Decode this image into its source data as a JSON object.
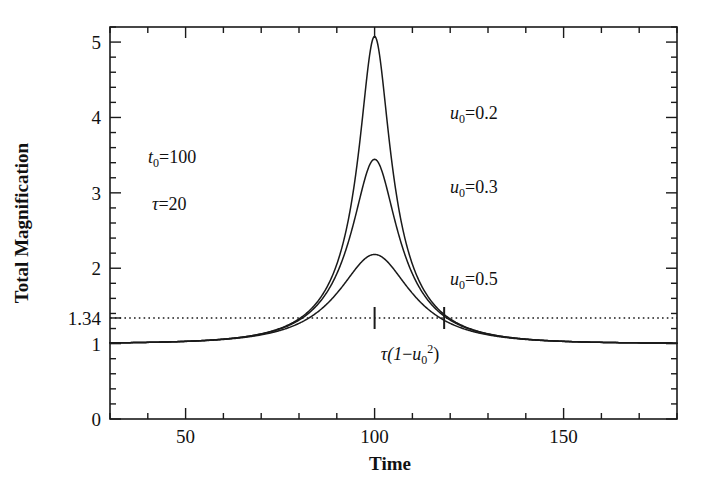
{
  "chart_data": {
    "type": "line",
    "title": "",
    "xlabel": "Time",
    "ylabel": "Total Magnification",
    "xlim": [
      30,
      180
    ],
    "ylim": [
      0,
      5.2
    ],
    "xticks_major": [
      50,
      100,
      150
    ],
    "xticks_major_labels": [
      "50",
      "100",
      "150"
    ],
    "xtick_minor_step": 10,
    "yticks_major": [
      0,
      1,
      2,
      3,
      4,
      5
    ],
    "yticks_major_labels": [
      "0",
      "1",
      "2",
      "3",
      "4",
      "5"
    ],
    "ytick_minor_step": 0.2,
    "extra_ytick": 1.34,
    "extra_ytick_label": "1.34",
    "grid": false,
    "legend": "inline-annotations",
    "reference_line": {
      "value": 1.34,
      "style": "dotted",
      "orientation": "horizontal",
      "label": "1.34"
    },
    "markers_on_reference_line": [
      100,
      118.4
    ],
    "marker_annotation": "τ(1−u₀²)",
    "model": "A(u) = (u^2+2) / (u*sqrt(u^2+4)),  u(t) = sqrt(u0^2 + ((t-t0)/tau)^2)",
    "parameters": {
      "t0": 100,
      "tau": 20
    },
    "series": [
      {
        "name": "u₀=0.2",
        "u0": 0.2,
        "peak_value": 5.07,
        "peak_x": 100,
        "x": [
          30,
          40,
          50,
          60,
          65,
          70,
          75,
          80,
          82,
          84,
          86,
          88,
          90,
          92,
          94,
          96,
          97,
          98,
          99,
          100,
          101,
          102,
          103,
          104,
          106,
          108,
          110,
          112,
          114,
          116,
          118,
          120,
          125,
          130,
          135,
          140,
          150,
          160,
          170,
          180
        ],
        "y": [
          1.001,
          1.003,
          1.01,
          1.032,
          1.055,
          1.097,
          1.169,
          1.293,
          1.369,
          1.468,
          1.597,
          1.767,
          1.992,
          2.291,
          2.688,
          3.198,
          3.492,
          3.803,
          4.1,
          5.07,
          4.1,
          3.803,
          3.492,
          3.198,
          2.688,
          2.291,
          1.992,
          1.767,
          1.597,
          1.468,
          1.369,
          1.293,
          1.169,
          1.097,
          1.055,
          1.032,
          1.01,
          1.003,
          1.001,
          1.001
        ]
      },
      {
        "name": "u₀=0.3",
        "u0": 0.3,
        "peak_value": 3.45,
        "peak_x": 100,
        "x": [
          30,
          40,
          50,
          60,
          65,
          70,
          75,
          80,
          82,
          84,
          86,
          88,
          90,
          92,
          94,
          96,
          97,
          98,
          99,
          100,
          101,
          102,
          103,
          104,
          106,
          108,
          110,
          112,
          114,
          116,
          118,
          120,
          125,
          130,
          135,
          140,
          150,
          160,
          170,
          180
        ],
        "y": [
          1.001,
          1.003,
          1.01,
          1.032,
          1.055,
          1.096,
          1.166,
          1.285,
          1.357,
          1.448,
          1.563,
          1.708,
          1.885,
          2.095,
          2.327,
          2.561,
          2.668,
          2.76,
          2.832,
          3.45,
          2.832,
          2.76,
          2.668,
          2.561,
          2.327,
          2.095,
          1.885,
          1.708,
          1.563,
          1.448,
          1.357,
          1.285,
          1.166,
          1.096,
          1.055,
          1.032,
          1.01,
          1.003,
          1.001,
          1.001
        ]
      },
      {
        "name": "u₀=0.5",
        "u0": 0.5,
        "peak_value": 2.18,
        "peak_x": 100,
        "x": [
          30,
          40,
          50,
          60,
          65,
          70,
          75,
          80,
          82,
          84,
          86,
          88,
          90,
          92,
          94,
          96,
          98,
          100,
          102,
          104,
          106,
          108,
          110,
          112,
          114,
          116,
          118,
          120,
          125,
          130,
          135,
          140,
          150,
          160,
          170,
          180
        ],
        "y": [
          1.001,
          1.003,
          1.01,
          1.031,
          1.053,
          1.091,
          1.153,
          1.252,
          1.308,
          1.374,
          1.451,
          1.538,
          1.632,
          1.73,
          1.826,
          1.911,
          1.976,
          2.18,
          1.976,
          1.911,
          1.826,
          1.73,
          1.632,
          1.538,
          1.451,
          1.374,
          1.308,
          1.252,
          1.153,
          1.091,
          1.053,
          1.031,
          1.01,
          1.003,
          1.001,
          1.001
        ]
      }
    ],
    "annotations": [
      {
        "id": "t0",
        "text": "t₀=100",
        "x_data": 47,
        "y_data": 3.38
      },
      {
        "id": "tau",
        "text": "τ=20",
        "x_data": 47,
        "y_data": 2.76
      },
      {
        "id": "u0-02",
        "text": "u₀=0.2",
        "x_data": 127,
        "y_data": 4.04
      },
      {
        "id": "u0-03",
        "text": "u₀=0.3",
        "x_data": 127,
        "y_data": 3.07
      },
      {
        "id": "u0-05",
        "text": "u₀=0.5",
        "x_data": 127,
        "y_data": 1.85
      },
      {
        "id": "tau-bracket",
        "text": "τ(1−u₀²)",
        "x_data": 110,
        "y_data": 0.87
      }
    ]
  },
  "labels": {
    "y_axis_title": "Total Magnification",
    "x_axis_title": "Time",
    "y_ticks": [
      "5",
      "4",
      "3",
      "2",
      "1.34",
      "1",
      "0"
    ],
    "x_ticks": [
      "50",
      "100",
      "150"
    ],
    "t0_text": "t",
    "t0_sub": "0",
    "t0_val": "=100",
    "tau_text": "τ",
    "tau_val": "=20",
    "u_text": "u",
    "u_sub": "0",
    "u1_val": "=0.2",
    "u2_val": "=0.3",
    "u3_val": "=0.5",
    "bracket_tau": "τ(1",
    "bracket_minus": "−",
    "bracket_u": "u",
    "bracket_sub": "0",
    "bracket_sup": "2",
    "bracket_close": ")"
  },
  "colors": {
    "curve": "#1a1a1a",
    "axis": "#1a1a1a",
    "background": "#ffffff",
    "reference_line": "#1a1a1a"
  }
}
